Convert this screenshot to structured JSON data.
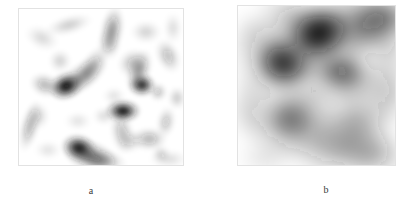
{
  "figure": {
    "background_color": "#ffffff",
    "panel_border_color": "#e2e2e2",
    "blob_color": "#1a1a1a",
    "panels": [
      {
        "id": "a",
        "caption": "a",
        "x": 18,
        "y": 8,
        "width": 166,
        "height": 158,
        "description": "grayscale speckle image with many small sharp dark spots"
      },
      {
        "id": "b",
        "caption": "b",
        "x": 237,
        "y": 5,
        "width": 159,
        "height": 161,
        "description": "grayscale image with fewer large diffuse dark blobs"
      }
    ]
  },
  "chart_data": {
    "type": "heatmap",
    "title": "",
    "xlabel": "",
    "ylabel": "",
    "grid": false,
    "legend": "none",
    "colormap": "grayscale-inverted",
    "value_range": [
      0,
      1
    ],
    "panels": [
      {
        "id": "a",
        "label": "a",
        "xlim": [
          0,
          166
        ],
        "ylim": [
          0,
          158
        ],
        "blobs": [
          {
            "cx": 48,
            "cy": 78,
            "rx": 9,
            "ry": 7,
            "rot": -20,
            "intensity": 1.0
          },
          {
            "cx": 62,
            "cy": 70,
            "rx": 16,
            "ry": 7,
            "rot": -35,
            "intensity": 0.38
          },
          {
            "cx": 73,
            "cy": 60,
            "rx": 13,
            "ry": 6,
            "rot": -55,
            "intensity": 0.3
          },
          {
            "cx": 105,
            "cy": 103,
            "rx": 9,
            "ry": 6,
            "rot": 0,
            "intensity": 0.98
          },
          {
            "cx": 61,
            "cy": 140,
            "rx": 9,
            "ry": 7,
            "rot": 15,
            "intensity": 0.95
          },
          {
            "cx": 72,
            "cy": 148,
            "rx": 14,
            "ry": 8,
            "rot": 20,
            "intensity": 0.52
          },
          {
            "cx": 84,
            "cy": 152,
            "rx": 12,
            "ry": 6,
            "rot": 10,
            "intensity": 0.34
          },
          {
            "cx": 124,
            "cy": 77,
            "rx": 7,
            "ry": 6,
            "rot": 0,
            "intensity": 0.88
          },
          {
            "cx": 121,
            "cy": 63,
            "rx": 6,
            "ry": 11,
            "rot": 20,
            "intensity": 0.4
          },
          {
            "cx": 115,
            "cy": 55,
            "rx": 8,
            "ry": 7,
            "rot": -30,
            "intensity": 0.26
          },
          {
            "cx": 94,
            "cy": 22,
            "rx": 6,
            "ry": 12,
            "rot": 10,
            "intensity": 0.42
          },
          {
            "cx": 91,
            "cy": 36,
            "rx": 6,
            "ry": 8,
            "rot": 0,
            "intensity": 0.22
          },
          {
            "cx": 51,
            "cy": 17,
            "rx": 12,
            "ry": 5,
            "rot": -15,
            "intensity": 0.18
          },
          {
            "cx": 24,
            "cy": 30,
            "rx": 9,
            "ry": 6,
            "rot": 25,
            "intensity": 0.14
          },
          {
            "cx": 128,
            "cy": 24,
            "rx": 8,
            "ry": 6,
            "rot": 0,
            "intensity": 0.16
          },
          {
            "cx": 150,
            "cy": 48,
            "rx": 6,
            "ry": 9,
            "rot": -25,
            "intensity": 0.26
          },
          {
            "cx": 140,
            "cy": 84,
            "rx": 5,
            "ry": 5,
            "rot": 0,
            "intensity": 0.22
          },
          {
            "cx": 159,
            "cy": 90,
            "rx": 5,
            "ry": 6,
            "rot": 0,
            "intensity": 0.18
          },
          {
            "cx": 27,
            "cy": 77,
            "rx": 8,
            "ry": 6,
            "rot": 20,
            "intensity": 0.3
          },
          {
            "cx": 12,
            "cy": 118,
            "rx": 5,
            "ry": 13,
            "rot": 15,
            "intensity": 0.3
          },
          {
            "cx": 20,
            "cy": 108,
            "rx": 6,
            "ry": 7,
            "rot": 0,
            "intensity": 0.16
          },
          {
            "cx": 42,
            "cy": 53,
            "rx": 6,
            "ry": 6,
            "rot": 0,
            "intensity": 0.16
          },
          {
            "cx": 104,
            "cy": 124,
            "rx": 6,
            "ry": 11,
            "rot": -10,
            "intensity": 0.26
          },
          {
            "cx": 112,
            "cy": 133,
            "rx": 7,
            "ry": 6,
            "rot": 0,
            "intensity": 0.18
          },
          {
            "cx": 131,
            "cy": 131,
            "rx": 9,
            "ry": 6,
            "rot": 0,
            "intensity": 0.3
          },
          {
            "cx": 148,
            "cy": 114,
            "rx": 5,
            "ry": 8,
            "rot": 10,
            "intensity": 0.22
          },
          {
            "cx": 143,
            "cy": 146,
            "rx": 5,
            "ry": 5,
            "rot": 0,
            "intensity": 0.14
          },
          {
            "cx": 151,
            "cy": 151,
            "rx": 10,
            "ry": 5,
            "rot": 0,
            "intensity": 0.12
          },
          {
            "cx": 86,
            "cy": 108,
            "rx": 6,
            "ry": 5,
            "rot": 0,
            "intensity": 0.12
          },
          {
            "cx": 60,
            "cy": 113,
            "rx": 7,
            "ry": 5,
            "rot": 0,
            "intensity": 0.1
          },
          {
            "cx": 155,
            "cy": 20,
            "rx": 5,
            "ry": 8,
            "rot": 0,
            "intensity": 0.12
          },
          {
            "cx": 30,
            "cy": 142,
            "rx": 7,
            "ry": 5,
            "rot": 0,
            "intensity": 0.1
          },
          {
            "cx": 96,
            "cy": 88,
            "rx": 6,
            "ry": 5,
            "rot": 0,
            "intensity": 0.1
          }
        ]
      },
      {
        "id": "b",
        "label": "b",
        "xlim": [
          0,
          159
        ],
        "ylim": [
          0,
          161
        ],
        "blobs": [
          {
            "cx": 82,
            "cy": 28,
            "rx": 17,
            "ry": 14,
            "rot": -25,
            "intensity": 1.0
          },
          {
            "cx": 88,
            "cy": 30,
            "rx": 30,
            "ry": 22,
            "rot": -25,
            "intensity": 0.45
          },
          {
            "cx": 46,
            "cy": 58,
            "rx": 16,
            "ry": 14,
            "rot": 20,
            "intensity": 0.82
          },
          {
            "cx": 46,
            "cy": 58,
            "rx": 28,
            "ry": 25,
            "rot": 20,
            "intensity": 0.36
          },
          {
            "cx": 62,
            "cy": 16,
            "rx": 24,
            "ry": 14,
            "rot": 30,
            "intensity": 0.26
          },
          {
            "cx": 134,
            "cy": 20,
            "rx": 24,
            "ry": 19,
            "rot": -15,
            "intensity": 0.52
          },
          {
            "cx": 146,
            "cy": 12,
            "rx": 16,
            "ry": 12,
            "rot": 0,
            "intensity": 0.34
          },
          {
            "cx": 108,
            "cy": 70,
            "rx": 22,
            "ry": 16,
            "rot": 10,
            "intensity": 0.48
          },
          {
            "cx": 104,
            "cy": 66,
            "rx": 12,
            "ry": 10,
            "rot": 0,
            "intensity": 0.3
          },
          {
            "cx": 56,
            "cy": 116,
            "rx": 24,
            "ry": 19,
            "rot": -10,
            "intensity": 0.45
          },
          {
            "cx": 52,
            "cy": 112,
            "rx": 14,
            "ry": 12,
            "rot": 0,
            "intensity": 0.25
          },
          {
            "cx": 96,
            "cy": 140,
            "rx": 28,
            "ry": 18,
            "rot": 5,
            "intensity": 0.34
          },
          {
            "cx": 120,
            "cy": 118,
            "rx": 22,
            "ry": 22,
            "rot": 0,
            "intensity": 0.34
          },
          {
            "cx": 136,
            "cy": 150,
            "rx": 20,
            "ry": 14,
            "rot": 0,
            "intensity": 0.28
          },
          {
            "cx": 150,
            "cy": 86,
            "rx": 14,
            "ry": 18,
            "rot": 0,
            "intensity": 0.22
          },
          {
            "cx": 14,
            "cy": 104,
            "rx": 14,
            "ry": 20,
            "rot": 0,
            "intensity": 0.16
          },
          {
            "cx": 20,
            "cy": 30,
            "rx": 16,
            "ry": 16,
            "rot": 0,
            "intensity": 0.12
          },
          {
            "cx": 152,
            "cy": 50,
            "rx": 12,
            "ry": 16,
            "rot": 0,
            "intensity": 0.14
          },
          {
            "cx": 80,
            "cy": 92,
            "rx": 16,
            "ry": 12,
            "rot": 0,
            "intensity": 0.1
          },
          {
            "cx": 30,
            "cy": 152,
            "rx": 18,
            "ry": 12,
            "rot": 0,
            "intensity": 0.1
          }
        ]
      }
    ]
  }
}
